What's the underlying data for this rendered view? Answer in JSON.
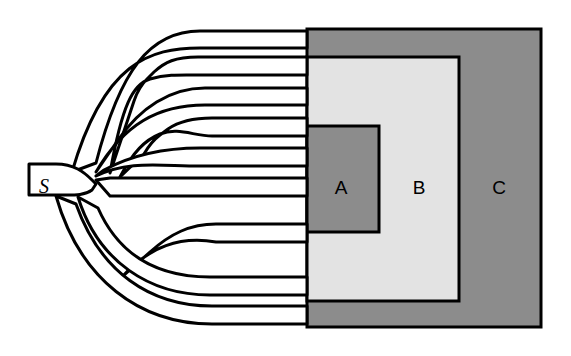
{
  "figure": {
    "background_color": "#ffffff",
    "stroke_color": "#000000"
  },
  "source": {
    "label": "S",
    "name": "source-node",
    "x": 44,
    "y": 187
  },
  "regions": [
    {
      "id": "A",
      "label": "A",
      "fill": "#8c8c8c",
      "stroke": "#000000",
      "x": 307,
      "y": 126,
      "width": 72,
      "height": 106,
      "label_x": 341,
      "label_y": 187
    },
    {
      "id": "B",
      "label": "B",
      "fill": "#e3e3e3",
      "stroke": "#000000",
      "x": 307,
      "y": 57,
      "width": 152,
      "height": 244,
      "label_x": 419,
      "label_y": 187
    },
    {
      "id": "C",
      "label": "C",
      "fill": "#8c8c8c",
      "stroke": "#000000",
      "x": 307,
      "y": 29,
      "width": 234,
      "height": 298,
      "label_x": 499,
      "label_y": 187
    }
  ],
  "channels": {
    "count": 9,
    "stroke_width": 3,
    "terminal_x": 307,
    "terminals": [
      {
        "index": 1,
        "y_top": 31,
        "y_bottom": 48
      },
      {
        "index": 2,
        "y_top": 57,
        "y_bottom": 75
      },
      {
        "index": 3,
        "y_top": 88,
        "y_bottom": 105
      },
      {
        "index": 4,
        "y_top": 118,
        "y_bottom": 136
      },
      {
        "index": 5,
        "y_top": 148,
        "y_bottom": 166
      },
      {
        "index": 6,
        "y_top": 178,
        "y_bottom": 196
      },
      {
        "index": 7,
        "y_top": 224,
        "y_bottom": 242
      },
      {
        "index": 8,
        "y_top": 277,
        "y_bottom": 295
      },
      {
        "index": 9,
        "y_top": 306,
        "y_bottom": 324
      }
    ],
    "root": {
      "entry_x": 29,
      "y_top": 164,
      "y_bottom": 195
    }
  }
}
